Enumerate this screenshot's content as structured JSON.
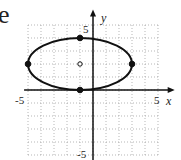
{
  "part_label": "e",
  "chart_data": {
    "type": "line",
    "title": "",
    "xlabel": "x",
    "ylabel": "y",
    "xlim": [
      -5,
      5
    ],
    "ylim": [
      -5,
      5
    ],
    "grid": true,
    "tick_labels": {
      "x": [
        "-5",
        "5"
      ],
      "y": [
        "5",
        "-5"
      ]
    },
    "curve": {
      "shape": "ellipse",
      "center": [
        -1,
        2
      ],
      "semi_major_x": 4,
      "semi_minor_y": 2,
      "equation": "(x+1)^2/16 + (y-2)^2/4 = 1"
    },
    "points": [
      {
        "label": "vertex-left",
        "x": -5,
        "y": 2,
        "style": "filled"
      },
      {
        "label": "vertex-right",
        "x": 3,
        "y": 2,
        "style": "filled"
      },
      {
        "label": "co-vertex-top",
        "x": -1,
        "y": 4,
        "style": "filled"
      },
      {
        "label": "co-vertex-bottom",
        "x": -1,
        "y": 0,
        "style": "filled"
      },
      {
        "label": "center",
        "x": -1,
        "y": 2,
        "style": "open"
      }
    ]
  },
  "labels": {
    "x_axis": "x",
    "y_axis": "y",
    "x_min": "-5",
    "x_max": "5",
    "y_max": "5",
    "y_min": "-5"
  }
}
